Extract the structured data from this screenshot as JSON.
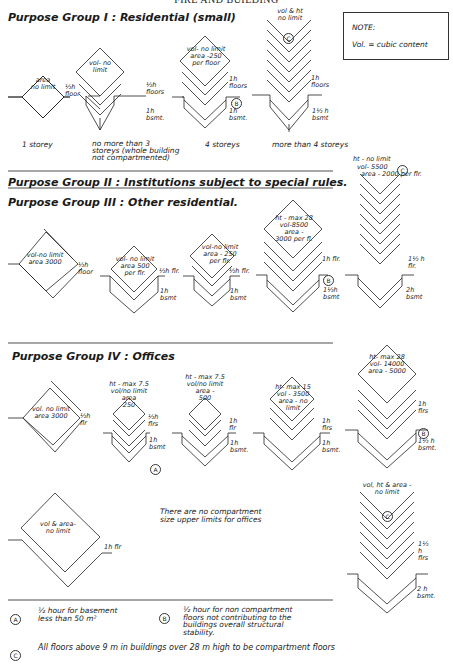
{
  "page": {
    "header": "FIRE AND BUILDING",
    "note": {
      "title": "NOTE:",
      "text": "Vol. = cubic content"
    }
  },
  "groups": [
    {
      "title": "Purpose Group I : Residential (small)",
      "diagrams": [
        {
          "inside": [
            "area",
            "no limit"
          ],
          "floor_label": "½h floor",
          "basement_label": "",
          "marker": "",
          "caption": [
            "1 storey"
          ]
        },
        {
          "inside": [
            "vol- no",
            "limit"
          ],
          "floor_label": "½h floors",
          "basement_label": "1h bsmt.",
          "marker": "",
          "caption": [
            "no more than 3",
            "storeys (whole building",
            "not compartmented)"
          ]
        },
        {
          "inside": [
            "vol- no limit",
            "area -250",
            "per floor"
          ],
          "floor_label": "1h floors",
          "basement_label": "1h bsmt.",
          "marker": "B",
          "caption": [
            "4 storeys"
          ]
        },
        {
          "inside": [
            "vol & ht",
            "no limit"
          ],
          "floor_label": "1h floors",
          "basement_label": "1½ h bsmt",
          "marker": "C",
          "caption": [
            "more than 4 storeys"
          ]
        }
      ]
    },
    {
      "title": "Purpose Group II : Institutions subject to special rules.",
      "diagrams": []
    },
    {
      "title": "Purpose Group III : Other residential.",
      "diagrams": [
        {
          "inside": [
            "vol-no limit",
            "area 3000"
          ],
          "floor_label": "½h floor",
          "basement_label": "",
          "marker": ""
        },
        {
          "inside": [
            "vol- no limit",
            "area 500",
            "per flr."
          ],
          "floor_label": "½h flr.",
          "basement_label": "1h bsmt",
          "marker": ""
        },
        {
          "inside": [
            "vol-no limit",
            "area - 250",
            "per flr."
          ],
          "floor_label": "½h flr.",
          "basement_label": "1h bsmt",
          "marker": ""
        },
        {
          "inside": [
            "ht - max 28",
            "vol-8500",
            "area -",
            "3000 per fl."
          ],
          "floor_label": "1h flr.",
          "basement_label": "1½h bsmt",
          "marker": "B"
        },
        {
          "inside": [
            "ht - no limit",
            "vol- 5500",
            "area - 2000 per flr."
          ],
          "floor_label": "1½ h flr.",
          "basement_label": "2h bsmt",
          "marker": "C"
        }
      ]
    },
    {
      "title": "Purpose Group IV : Offices",
      "diagrams": [
        {
          "inside": [
            "vol. no limit",
            "area 3000"
          ],
          "floor_label": "½h flr",
          "basement_label": "",
          "marker": ""
        },
        {
          "inside": [
            "ht - max 7.5",
            "vol/no limit",
            "area",
            "250"
          ],
          "floor_label": "½h flrs",
          "basement_label": "1h bsmt",
          "marker": "A"
        },
        {
          "inside": [
            "ht - max 7.5",
            "vol/no limit",
            "area -",
            "500"
          ],
          "floor_label": "1h flr",
          "basement_label": "1h bsmt.",
          "marker": ""
        },
        {
          "inside": [
            "ht- max 15",
            "vol - 3500",
            "area - no",
            "limit"
          ],
          "floor_label": "1h flrs",
          "basement_label": "1h bsmt.",
          "marker": ""
        },
        {
          "inside": [
            "ht- max 28",
            "vol- 14000",
            "area - 5000"
          ],
          "floor_label": "1h flrs",
          "basement_label": "1½ h bsmt.",
          "marker": "B"
        },
        {
          "inside": [
            "vol & area-",
            "no limit"
          ],
          "floor_label": "1h flr",
          "basement_label": "",
          "marker": ""
        },
        {
          "inside": [
            "vol, ht & area -",
            "no limit"
          ],
          "floor_label": "1½ h flrs",
          "basement_label": "2 h bsmt.",
          "marker": "C"
        }
      ],
      "remark": [
        "There are no compartment",
        "size upper limits for offices"
      ]
    }
  ],
  "footnotes": [
    {
      "marker": "A",
      "text": [
        "½ hour for basement",
        "less than 50 m²"
      ]
    },
    {
      "marker": "B",
      "text": [
        "½ hour for non compartment",
        "floors not contributing to the",
        "buildings overall structural",
        "stability."
      ]
    },
    {
      "marker": "C",
      "text": [
        "All floors above 9 m in buildings over 28 m high to be compartment floors"
      ]
    }
  ]
}
